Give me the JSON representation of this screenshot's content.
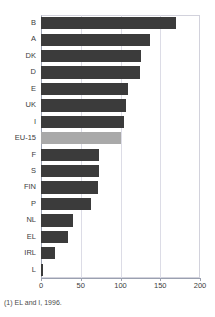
{
  "chart_data": {
    "type": "bar",
    "orientation": "horizontal",
    "title": "",
    "xlabel": "",
    "ylabel": "",
    "xlim": [
      0,
      200
    ],
    "xticks": [
      0,
      50,
      100,
      150,
      200
    ],
    "grid": true,
    "legend": "none",
    "categories": [
      "B",
      "A",
      "DK",
      "D",
      "E",
      "UK",
      "I",
      "EU-15",
      "F",
      "S",
      "FIN",
      "P",
      "NL",
      "EL",
      "IRL",
      "L"
    ],
    "values": [
      170,
      137,
      126,
      125,
      110,
      107,
      105,
      100,
      73,
      73,
      72,
      63,
      40,
      34,
      17,
      2
    ],
    "highlight_category": "EU-15",
    "series": [
      {
        "name": "value",
        "values": [
          170,
          137,
          126,
          125,
          110,
          107,
          105,
          100,
          73,
          73,
          72,
          63,
          40,
          34,
          17,
          2
        ]
      }
    ],
    "annotations": [
      "(1) EL and I, 1996."
    ]
  },
  "chart": {
    "title_strip": "",
    "bars": [
      {
        "label": "B",
        "value": 170,
        "highlight": false
      },
      {
        "label": "A",
        "value": 137,
        "highlight": false
      },
      {
        "label": "DK",
        "value": 126,
        "highlight": false
      },
      {
        "label": "D",
        "value": 125,
        "highlight": false
      },
      {
        "label": "E",
        "value": 110,
        "highlight": false
      },
      {
        "label": "UK",
        "value": 107,
        "highlight": false
      },
      {
        "label": "I",
        "value": 105,
        "highlight": false
      },
      {
        "label": "EU-15",
        "value": 100,
        "highlight": true
      },
      {
        "label": "F",
        "value": 73,
        "highlight": false
      },
      {
        "label": "S",
        "value": 73,
        "highlight": false
      },
      {
        "label": "FIN",
        "value": 72,
        "highlight": false
      },
      {
        "label": "P",
        "value": 63,
        "highlight": false
      },
      {
        "label": "NL",
        "value": 40,
        "highlight": false
      },
      {
        "label": "EL",
        "value": 34,
        "highlight": false
      },
      {
        "label": "IRL",
        "value": 17,
        "highlight": false
      },
      {
        "label": "L",
        "value": 2,
        "highlight": false
      }
    ],
    "xticks": [
      "0",
      "50",
      "100",
      "150",
      "200"
    ],
    "xtick_values": [
      0,
      50,
      100,
      150,
      200
    ],
    "footnote": "(1) EL and I, 1996."
  },
  "colors": {
    "bar": "#3b3b3b",
    "bar_highlight": "#a9a9a9",
    "grid": "#dcdce6",
    "axis": "#9aa0b0",
    "text": "#3c3c3c",
    "background": "#ffffff"
  }
}
